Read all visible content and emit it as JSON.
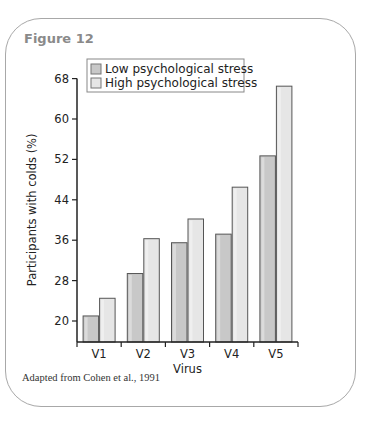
{
  "figure": {
    "title": "Figure 12",
    "source": "Adapted from Cohen et al., 1991"
  },
  "colors": {
    "low": "#c8c8c8",
    "high": "#e6e6e6",
    "border": "#a8a8a8",
    "title": "#8a8a8a"
  },
  "chart_data": {
    "type": "bar",
    "title": "",
    "xlabel": "Virus",
    "ylabel": "Participants with colds (%)",
    "categories": [
      "V1",
      "V2",
      "V3",
      "V4",
      "V5"
    ],
    "series": [
      {
        "name": "Low psychological stress",
        "values": [
          21,
          29.4,
          35.5,
          37.2,
          52.7
        ]
      },
      {
        "name": "High psychological stress",
        "values": [
          24.5,
          36.3,
          40.2,
          46.5,
          66.5
        ]
      }
    ],
    "yticks": [
      20,
      28,
      36,
      44,
      52,
      60,
      68
    ],
    "ylim": [
      15.5,
      68
    ],
    "grid": false,
    "legend_position": "top-left inside"
  }
}
